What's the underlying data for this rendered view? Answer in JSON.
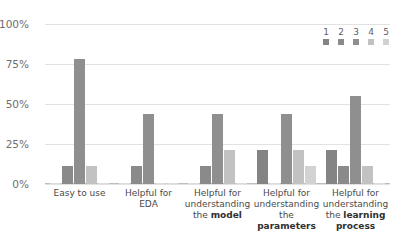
{
  "chart_data": {
    "type": "bar",
    "title": "",
    "subtitle": "",
    "xlabel": "",
    "ylabel": "",
    "ylim": [
      0,
      100
    ],
    "ytick_labels": [
      "0%",
      "25%",
      "50%",
      "75%",
      "100%"
    ],
    "ytick_values": [
      0,
      25,
      50,
      75,
      100
    ],
    "grid": true,
    "legend_position": "top-right",
    "legend_title": "",
    "categories": [
      "Easy to use",
      "Helpful for EDA",
      "Helpful for understanding the model",
      "Helpful for understanding the parameters",
      "Helpful for understanding the learning process"
    ],
    "category_lines": [
      [
        {
          "text": "Easy to use",
          "bold": false
        }
      ],
      [
        {
          "text": "Helpful for",
          "bold": false
        },
        {
          "text": "EDA",
          "bold": false
        }
      ],
      [
        {
          "text": "Helpful for",
          "bold": false
        },
        {
          "text": "understanding",
          "bold": false
        },
        {
          "text": "the ",
          "bold": false
        },
        {
          "text": "model",
          "bold": true
        }
      ],
      [
        {
          "text": "Helpful for",
          "bold": false
        },
        {
          "text": "understanding",
          "bold": false
        },
        {
          "text": "the ",
          "bold": false
        },
        {
          "text": "parameters",
          "bold": true
        }
      ],
      [
        {
          "text": "Helpful for",
          "bold": false
        },
        {
          "text": "understanding",
          "bold": false
        },
        {
          "text": "the ",
          "bold": false
        },
        {
          "text": "learning",
          "bold": true
        },
        {
          "text": "process",
          "bold": true
        }
      ]
    ],
    "series": [
      {
        "name": "1",
        "color": "#848484",
        "values": [
          0,
          0,
          0,
          21,
          21
        ]
      },
      {
        "name": "2",
        "color": "#8a8a8a",
        "values": [
          11,
          11,
          11,
          0,
          11
        ]
      },
      {
        "name": "3",
        "color": "#8f8f8f",
        "values": [
          78,
          44,
          44,
          44,
          55
        ]
      },
      {
        "name": "4",
        "color": "#c2c2c2",
        "values": [
          11,
          0,
          21,
          21,
          11
        ]
      },
      {
        "name": "5",
        "color": "#d2d2d2",
        "values": [
          0,
          0,
          0,
          11,
          0
        ]
      }
    ]
  },
  "legend": {
    "items": [
      {
        "label": "1",
        "color": "#848484"
      },
      {
        "label": "2",
        "color": "#8a8a8a"
      },
      {
        "label": "3",
        "color": "#8f8f8f"
      },
      {
        "label": "4",
        "color": "#c2c2c2"
      },
      {
        "label": "5",
        "color": "#d2d2d2"
      }
    ]
  },
  "colors": {
    "gridline": "#e2e2e2",
    "axis": "#bdbdbd",
    "tick_text": "#6e6e6e",
    "label_text": "#4a4a4a",
    "background": "#ffffff"
  }
}
